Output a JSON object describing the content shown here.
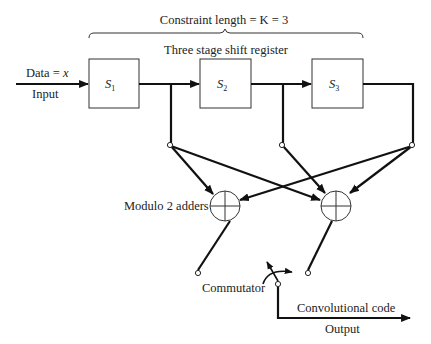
{
  "diagram": {
    "title": "Constraint length = K = 3",
    "register_label": "Three stage shift register",
    "input": {
      "data_label_prefix": "Data = ",
      "data_label_var": "x",
      "input_label": "Input"
    },
    "stages": [
      {
        "id": "S1",
        "symbol": "S",
        "subscript": "1"
      },
      {
        "id": "S2",
        "symbol": "S",
        "subscript": "2"
      },
      {
        "id": "S3",
        "symbol": "S",
        "subscript": "3"
      }
    ],
    "adders_label": "Modulo 2 adders",
    "adders": [
      {
        "id": "adder-1",
        "inputs": [
          "S1 tap",
          "S3 tap"
        ]
      },
      {
        "id": "adder-2",
        "inputs": [
          "S1 tap",
          "S2 tap",
          "S3 tap"
        ]
      }
    ],
    "commutator_label": "Commutator",
    "output": {
      "code_label": "Convolutional code",
      "output_label": "Output"
    },
    "colors": {
      "line": "#111111",
      "box_stroke": "#333333",
      "background": "#ffffff"
    }
  }
}
